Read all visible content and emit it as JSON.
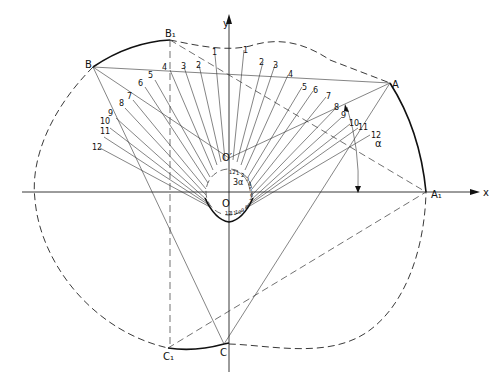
{
  "diagram": {
    "axes": {
      "x_label": "x",
      "y_label": "y"
    },
    "points": {
      "O": "O",
      "O_prime": "O′",
      "A": "A",
      "A1": "A₁",
      "B": "B",
      "B1": "B₁",
      "C": "C",
      "C1": "C₁"
    },
    "angles": {
      "alpha": "α",
      "three_alpha": "3α"
    },
    "ray_labels_right": [
      "1",
      "2",
      "3",
      "4",
      "5",
      "6",
      "7",
      "8",
      "9",
      "10",
      "11",
      "12"
    ],
    "ray_labels_left": [
      "1",
      "2",
      "3",
      "4",
      "5",
      "6",
      "7",
      "8",
      "9",
      "10",
      "11",
      "12"
    ],
    "small_circle_labels": [
      "12",
      "1",
      "2",
      "3",
      "4",
      "5",
      "6",
      "7",
      "8",
      "9",
      "10",
      "11",
      "12"
    ]
  }
}
